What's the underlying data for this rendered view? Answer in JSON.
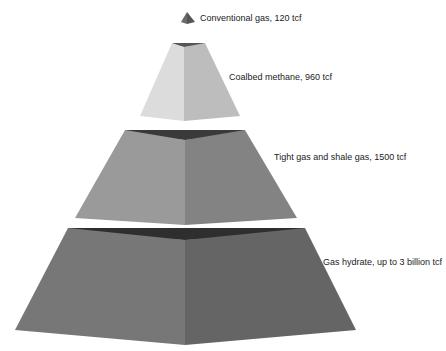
{
  "diagram": {
    "type": "resource-pyramid",
    "tiers": [
      {
        "label": "Conventional gas, 120 tcf",
        "color_left": "#6a6a6a",
        "color_right": "#555555",
        "color_top": "#444444"
      },
      {
        "label": "Coalbed methane, 960 tcf",
        "color_left": "#dcdcdc",
        "color_right": "#bdbdbd",
        "color_top": "#555555"
      },
      {
        "label": "Tight gas and shale gas, 1500 tcf",
        "color_left": "#9a9a9a",
        "color_right": "#838383",
        "color_top": "#3a3a3a"
      },
      {
        "label": "Gas hydrate, up to 3 billion tcf",
        "color_left": "#777777",
        "color_right": "#656565",
        "color_top": "#2e2e2e"
      }
    ]
  }
}
